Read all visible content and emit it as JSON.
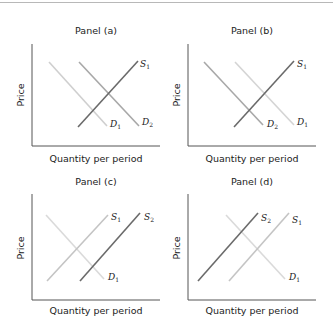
{
  "figure": {
    "panels": [
      {
        "id": "a",
        "title": "Panel (a)",
        "xlabel": "Quantity per period",
        "ylabel": "Price",
        "curves": [
          {
            "name": "D",
            "sub": "1",
            "type": "demand",
            "color": "#cfcfcf"
          },
          {
            "name": "D",
            "sub": "2",
            "type": "demand",
            "color": "#a8a8a8"
          },
          {
            "name": "S",
            "sub": "1",
            "type": "supply",
            "color": "#6a6a6a"
          }
        ]
      },
      {
        "id": "b",
        "title": "Panel (b)",
        "xlabel": "Quantity per period",
        "ylabel": "Price",
        "curves": [
          {
            "name": "D",
            "sub": "2",
            "type": "demand",
            "color": "#a8a8a8"
          },
          {
            "name": "D",
            "sub": "1",
            "type": "demand",
            "color": "#d4d4d4"
          },
          {
            "name": "S",
            "sub": "1",
            "type": "supply",
            "color": "#6a6a6a"
          }
        ]
      },
      {
        "id": "c",
        "title": "Panel (c)",
        "xlabel": "Quantity per period",
        "ylabel": "Price",
        "curves": [
          {
            "name": "S",
            "sub": "1",
            "type": "supply",
            "color": "#c4c4c4"
          },
          {
            "name": "S",
            "sub": "2",
            "type": "supply",
            "color": "#6a6a6a"
          },
          {
            "name": "D",
            "sub": "1",
            "type": "demand",
            "color": "#dadada"
          }
        ]
      },
      {
        "id": "d",
        "title": "Panel (d)",
        "xlabel": "Quantity per period",
        "ylabel": "Price",
        "curves": [
          {
            "name": "S",
            "sub": "2",
            "type": "supply",
            "color": "#6a6a6a"
          },
          {
            "name": "S",
            "sub": "1",
            "type": "supply",
            "color": "#c4c4c4"
          },
          {
            "name": "D",
            "sub": "1",
            "type": "demand",
            "color": "#dadada"
          }
        ]
      }
    ],
    "colors": {
      "axis": "#555555",
      "text": "#222222",
      "rule": "#b8b8b8"
    }
  }
}
